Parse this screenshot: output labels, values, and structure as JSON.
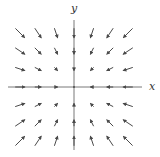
{
  "diagram": {
    "type": "vector_field",
    "title": "",
    "field_description": "Field read as F(x,y) = (-x, -y), inward toward the origin; arrow direction inferred from segment orientation because the arrowheads do not resolve at this resolution (an outward field F = (x, y) looks the same).",
    "x_label": "x",
    "y_label": "y",
    "grid": {
      "x_values": [
        -3,
        -2,
        -1,
        0,
        1,
        2,
        3
      ],
      "y_values": [
        -3,
        -2,
        -1,
        0,
        1,
        2,
        3
      ]
    },
    "colors": {
      "axis": "#555555",
      "arrow": "#4a4a4a",
      "label": "#333333",
      "background": "#ffffff"
    }
  },
  "chart_data": {
    "type": "vector_field",
    "title": "",
    "xlabel": "x",
    "ylabel": "y",
    "field": "F(x,y) = (-x, -y)",
    "direction_note": "inferred from quadrant orientation; arrowheads not legible",
    "x_range": [
      -3,
      3
    ],
    "y_range": [
      -3,
      3
    ],
    "grid_points": 49
  }
}
